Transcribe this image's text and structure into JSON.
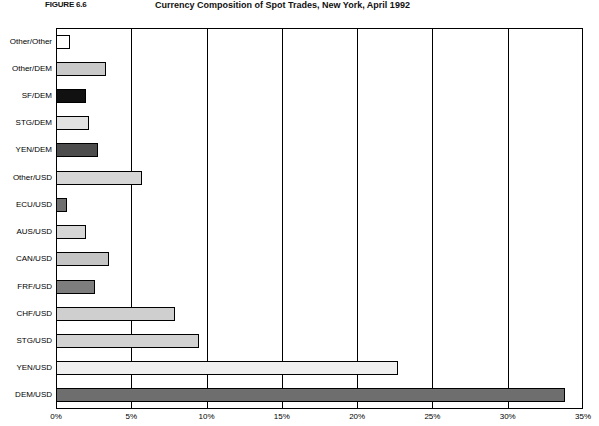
{
  "figure": {
    "caption": "FIGURE 6.6",
    "title": "Currency Composition of Spot Trades, New York, April 1992"
  },
  "chart_data": {
    "type": "bar",
    "orientation": "horizontal",
    "title": "Currency Composition of Spot Trades, New York, April 1992",
    "xlabel": "",
    "ylabel": "",
    "xlim": [
      0,
      35
    ],
    "xticks": [
      "0%",
      "5%",
      "10%",
      "15%",
      "20%",
      "25%",
      "30%",
      "35%"
    ],
    "xtick_values": [
      0,
      5,
      10,
      15,
      20,
      25,
      30,
      35
    ],
    "grid": true,
    "legend": "none",
    "categories": [
      "Other/Other",
      "Other/DEM",
      "SF/DEM",
      "STG/DEM",
      "YEN/DEM",
      "Other/USD",
      "ECU/USD",
      "AUS/USD",
      "CAN/USD",
      "FRF/USD",
      "CHF/USD",
      "STG/USD",
      "YEN/USD",
      "DEM/USD"
    ],
    "values": [
      0.9,
      3.3,
      2.0,
      2.2,
      2.8,
      5.7,
      0.7,
      2.0,
      3.5,
      2.6,
      7.9,
      9.5,
      22.7,
      33.8
    ],
    "bar_colors": [
      "#ffffff",
      "#c9c9c9",
      "#111111",
      "#e2e2e2",
      "#4d4d4d",
      "#d6d6d6",
      "#6f6f6f",
      "#d6d6d6",
      "#c4c4c4",
      "#7d7d7d",
      "#cfcfcf",
      "#d2d2d2",
      "#efefef",
      "#6e6e6e"
    ]
  }
}
